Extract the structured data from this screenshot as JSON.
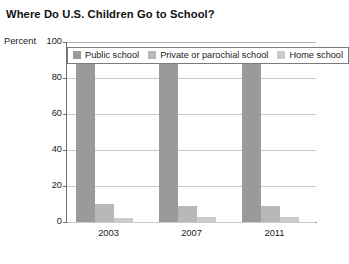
{
  "chart_data": {
    "type": "bar",
    "title": "Where Do U.S. Children Go to School?",
    "xlabel": "",
    "ylabel": "Percent",
    "categories": [
      "2003",
      "2007",
      "2011"
    ],
    "series": [
      {
        "name": "Public school",
        "values": [
          88,
          88,
          89
        ],
        "color": "#9a9a9a"
      },
      {
        "name": "Private or parochial school",
        "values": [
          10,
          9,
          9
        ],
        "color": "#b8b8b8"
      },
      {
        "name": "Home school",
        "values": [
          2,
          3,
          3
        ],
        "color": "#cccccc"
      }
    ],
    "ylim": [
      0,
      100
    ],
    "yticks": [
      "0",
      "20",
      "40",
      "60",
      "80",
      "100"
    ],
    "grid": true,
    "legend_position": "top-inside"
  },
  "axes": {
    "y_unit_label": "Percent"
  }
}
